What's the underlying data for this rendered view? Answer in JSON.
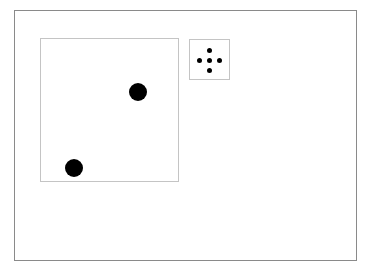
{
  "board": {
    "frame": {
      "x": 14,
      "y": 10,
      "w": 343,
      "h": 251,
      "border": "#8a8a8a"
    },
    "dice": [
      {
        "name": "large-die",
        "x": 40,
        "y": 38,
        "w": 139,
        "h": 144,
        "border": "#c4c4c4",
        "pips": [
          {
            "cx": 138,
            "cy": 92,
            "r": 9
          },
          {
            "cx": 74,
            "cy": 168,
            "r": 9
          }
        ]
      },
      {
        "name": "small-die",
        "x": 189,
        "y": 39,
        "w": 41,
        "h": 41,
        "border": "#c4c4c4",
        "pips": [
          {
            "cx": 209,
            "cy": 50,
            "r": 2.5
          },
          {
            "cx": 199,
            "cy": 60,
            "r": 2.5
          },
          {
            "cx": 209,
            "cy": 60,
            "r": 2.5
          },
          {
            "cx": 219,
            "cy": 60,
            "r": 2.5
          },
          {
            "cx": 209,
            "cy": 70,
            "r": 2.5
          }
        ]
      }
    ],
    "pip_color": "#000000"
  }
}
